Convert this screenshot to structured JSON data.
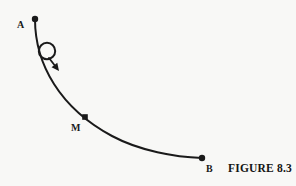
{
  "figure": {
    "caption": "FIGURE 8.3",
    "background_color": "#f8f8f6",
    "ink_color": "#1a1a1a"
  },
  "labels": {
    "start_point": "A",
    "mid_point": "M",
    "end_point": "B"
  },
  "chart_data": {
    "type": "line",
    "title": "FIGURE 8.3",
    "xlabel": "",
    "ylabel": "",
    "points": [
      {
        "name": "A",
        "x": 35,
        "y": 19,
        "marker": "filled-circle"
      },
      {
        "name": "M",
        "x": 85,
        "y": 117,
        "marker": "filled-square"
      },
      {
        "name": "B",
        "x": 202,
        "y": 158,
        "marker": "filled-circle"
      }
    ],
    "curve_path": "M 35 19 C 35 40, 40 62, 54 84 C 66 103, 84 121, 112 136 C 140 151, 175 157, 202 158",
    "ball": {
      "cx": 47,
      "cy": 51,
      "r": 8.2,
      "filled": false
    },
    "arrow": {
      "x1": 49,
      "y1": 58,
      "x2": 59,
      "y2": 71,
      "direction": "down-right"
    },
    "grid": false,
    "legend": "none"
  }
}
